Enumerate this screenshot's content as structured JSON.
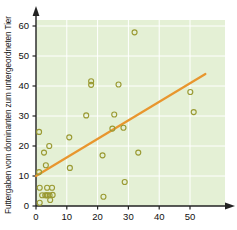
{
  "chart_data": {
    "type": "scatter",
    "title": "",
    "xlabel": "",
    "ylabel": "Futtergaben vom dominanten zum untergeordneten Tier",
    "xlim": [
      0,
      61
    ],
    "ylim": [
      0,
      64
    ],
    "xticks": [
      0,
      10,
      20,
      30,
      40,
      50
    ],
    "yticks": [
      0,
      10,
      20,
      30,
      40,
      50,
      60
    ],
    "grid": true,
    "legend": "none",
    "marker": "open-circle",
    "marker_color": "#9a9a33",
    "plot_background": "#e4f0d5",
    "grid_color": "#ffffff",
    "axis_color": "#222222",
    "trendline": {
      "color": "#e8962e",
      "x": [
        0,
        55
      ],
      "y": [
        10,
        44
      ]
    },
    "points": [
      {
        "x": 1.0,
        "y": 24.7
      },
      {
        "x": 1.0,
        "y": 11.3
      },
      {
        "x": 1.2,
        "y": 6.1
      },
      {
        "x": 1.2,
        "y": 1.1
      },
      {
        "x": 2.0,
        "y": 3.6
      },
      {
        "x": 2.6,
        "y": 17.8
      },
      {
        "x": 3.0,
        "y": 3.6
      },
      {
        "x": 3.2,
        "y": 13.6
      },
      {
        "x": 3.4,
        "y": 3.6
      },
      {
        "x": 3.6,
        "y": 6.1
      },
      {
        "x": 3.8,
        "y": 3.6
      },
      {
        "x": 4.3,
        "y": 20.0
      },
      {
        "x": 4.4,
        "y": 3.6
      },
      {
        "x": 4.6,
        "y": 2.0
      },
      {
        "x": 5.2,
        "y": 6.1
      },
      {
        "x": 5.4,
        "y": 3.7
      },
      {
        "x": 10.8,
        "y": 22.9
      },
      {
        "x": 11.0,
        "y": 12.7
      },
      {
        "x": 16.3,
        "y": 30.2
      },
      {
        "x": 17.9,
        "y": 41.6
      },
      {
        "x": 17.9,
        "y": 40.4
      },
      {
        "x": 21.6,
        "y": 16.9
      },
      {
        "x": 21.9,
        "y": 3.1
      },
      {
        "x": 24.8,
        "y": 25.8
      },
      {
        "x": 25.4,
        "y": 30.5
      },
      {
        "x": 26.8,
        "y": 40.5
      },
      {
        "x": 28.4,
        "y": 26.1
      },
      {
        "x": 28.8,
        "y": 8.0
      },
      {
        "x": 32.0,
        "y": 57.9
      },
      {
        "x": 33.2,
        "y": 17.8
      },
      {
        "x": 50.1,
        "y": 38.0
      },
      {
        "x": 51.2,
        "y": 31.3
      }
    ]
  }
}
